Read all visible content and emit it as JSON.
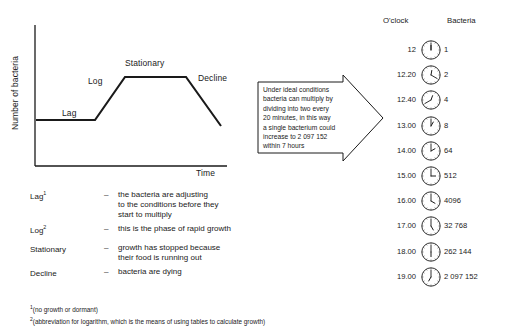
{
  "graph": {
    "y_axis_title": "Number of bacteria",
    "x_axis_title": "Time",
    "phase_labels": {
      "lag": "Lag",
      "log": "Log",
      "stationary": "Stationary",
      "decline": "Decline"
    }
  },
  "chart_data": {
    "type": "line",
    "title": "",
    "xlabel": "Time",
    "ylabel": "Number of bacteria",
    "grid": false,
    "legend": "none",
    "annotations": [
      "Lag",
      "Log",
      "Stationary",
      "Decline"
    ],
    "series": [
      {
        "name": "Bacterial growth curve",
        "points": [
          {
            "x": 0,
            "y": 28,
            "phase": "Lag"
          },
          {
            "x": 31,
            "y": 28,
            "phase": "Lag"
          },
          {
            "x": 60,
            "y": 85,
            "phase": "Log"
          },
          {
            "x": 79,
            "y": 85,
            "phase": "Stationary"
          },
          {
            "x": 100,
            "y": 26,
            "phase": "Decline"
          }
        ]
      }
    ],
    "xlim": [
      0,
      100
    ],
    "ylim": [
      0,
      100
    ]
  },
  "callout": {
    "lines": [
      "Under ideal conditions",
      "bacteria can multiply by",
      "dividing into two every",
      "20 minutes, in this way",
      "a single bacterium could",
      "increase to 2 097 152",
      "within 7 hours"
    ]
  },
  "clock_table": {
    "headers": {
      "time": "O'clock",
      "bacteria": "Bacteria"
    },
    "rows": [
      {
        "time": "12",
        "bacteria": "1",
        "hour_deg": 0,
        "minute_deg": 0
      },
      {
        "time": "12.20",
        "bacteria": "2",
        "hour_deg": 10,
        "minute_deg": 120
      },
      {
        "time": "12.40",
        "bacteria": "4",
        "hour_deg": 20,
        "minute_deg": 240
      },
      {
        "time": "13.00",
        "bacteria": "8",
        "hour_deg": 30,
        "minute_deg": 0
      },
      {
        "time": "14.00",
        "bacteria": "64",
        "hour_deg": 60,
        "minute_deg": 0
      },
      {
        "time": "15.00",
        "bacteria": "512",
        "hour_deg": 90,
        "minute_deg": 0
      },
      {
        "time": "16.00",
        "bacteria": "4096",
        "hour_deg": 120,
        "minute_deg": 0
      },
      {
        "time": "17.00",
        "bacteria": "32 768",
        "hour_deg": 150,
        "minute_deg": 0
      },
      {
        "time": "18.00",
        "bacteria": "262 144",
        "hour_deg": 180,
        "minute_deg": 0
      },
      {
        "time": "19.00",
        "bacteria": "2 097 152",
        "hour_deg": 210,
        "minute_deg": 0
      }
    ]
  },
  "definitions": {
    "dash": "–",
    "items": [
      {
        "term": "Lag",
        "superscript": "1",
        "text": "the bacteria are adjusting\nto the conditions before they\nstart to multiply"
      },
      {
        "term": "Log",
        "superscript": "2",
        "text": "this is the phase of rapid growth"
      },
      {
        "term": "Stationary",
        "superscript": "",
        "text": "growth has stopped because\ntheir food is running out"
      },
      {
        "term": "Decline",
        "superscript": "",
        "text": "bacteria are dying"
      }
    ]
  },
  "footnotes": [
    {
      "marker": "1",
      "text": "(no growth or dormant)"
    },
    {
      "marker": "2",
      "text": "(abbreviation for logarithm, which is the means of using tables to calculate growth)"
    }
  ]
}
